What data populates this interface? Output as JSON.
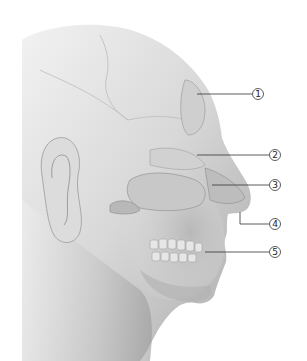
{
  "figure": {
    "facing": "right",
    "background": "#ffffff",
    "colors": {
      "skin_light": "#ececec",
      "skin_mid": "#c9c9c9",
      "skin_dark": "#8f8f8f",
      "leader_line": "#333333",
      "callout_stroke": "#333333"
    }
  },
  "callouts": [
    {
      "number": "1",
      "label": "①",
      "x": 258,
      "y": 94,
      "line_from_x": 197,
      "line_from_y": 94
    },
    {
      "number": "2",
      "label": "②",
      "x": 275,
      "y": 155,
      "line_from_x": 197,
      "line_from_y": 155
    },
    {
      "number": "3",
      "label": "③",
      "x": 275,
      "y": 185,
      "line_from_x": 212,
      "line_from_y": 185
    },
    {
      "number": "4",
      "label": "④",
      "x": 275,
      "y": 224,
      "line_from_x": 240,
      "line_from_y": 212
    },
    {
      "number": "5",
      "label": "⑤",
      "x": 275,
      "y": 252,
      "line_from_x": 205,
      "line_from_y": 252
    }
  ]
}
